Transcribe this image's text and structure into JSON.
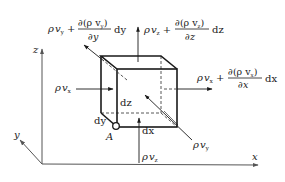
{
  "figure": {
    "axes": {
      "x_label": "x",
      "y_label": "y",
      "z_label": "z"
    },
    "corner_label": "A",
    "dimensions": {
      "dx": "dx",
      "dy": "dy",
      "dz": "dz"
    },
    "fluxes": {
      "in_x": {
        "rho": "ρ",
        "v": "v",
        "sub": "x"
      },
      "in_y": {
        "rho": "ρ",
        "v": "v",
        "sub": "y"
      },
      "in_z": {
        "rho": "ρ",
        "v": "v",
        "sub": "z"
      },
      "out_x": {
        "rho": "ρ",
        "v": "v",
        "sub": "x",
        "plus": "+",
        "numerator": "∂(ρ v",
        "num_sub": "x",
        "num_close": ")",
        "denominator": "∂x",
        "differential": "dx"
      },
      "out_y": {
        "rho": "ρ",
        "v": "v",
        "sub": "y",
        "plus": "+",
        "numerator": "∂(ρ v",
        "num_sub": "y",
        "num_close": ")",
        "denominator": "∂y",
        "differential": "dy"
      },
      "out_z": {
        "rho": "ρ",
        "v": "v",
        "sub": "z",
        "plus": "+",
        "numerator": "∂(ρ v",
        "num_sub": "z",
        "num_close": ")",
        "denominator": "∂z",
        "differential": "dz"
      }
    },
    "colors": {
      "ink": "#1a1a1a",
      "axis": "#555555",
      "background": "#ffffff"
    }
  }
}
